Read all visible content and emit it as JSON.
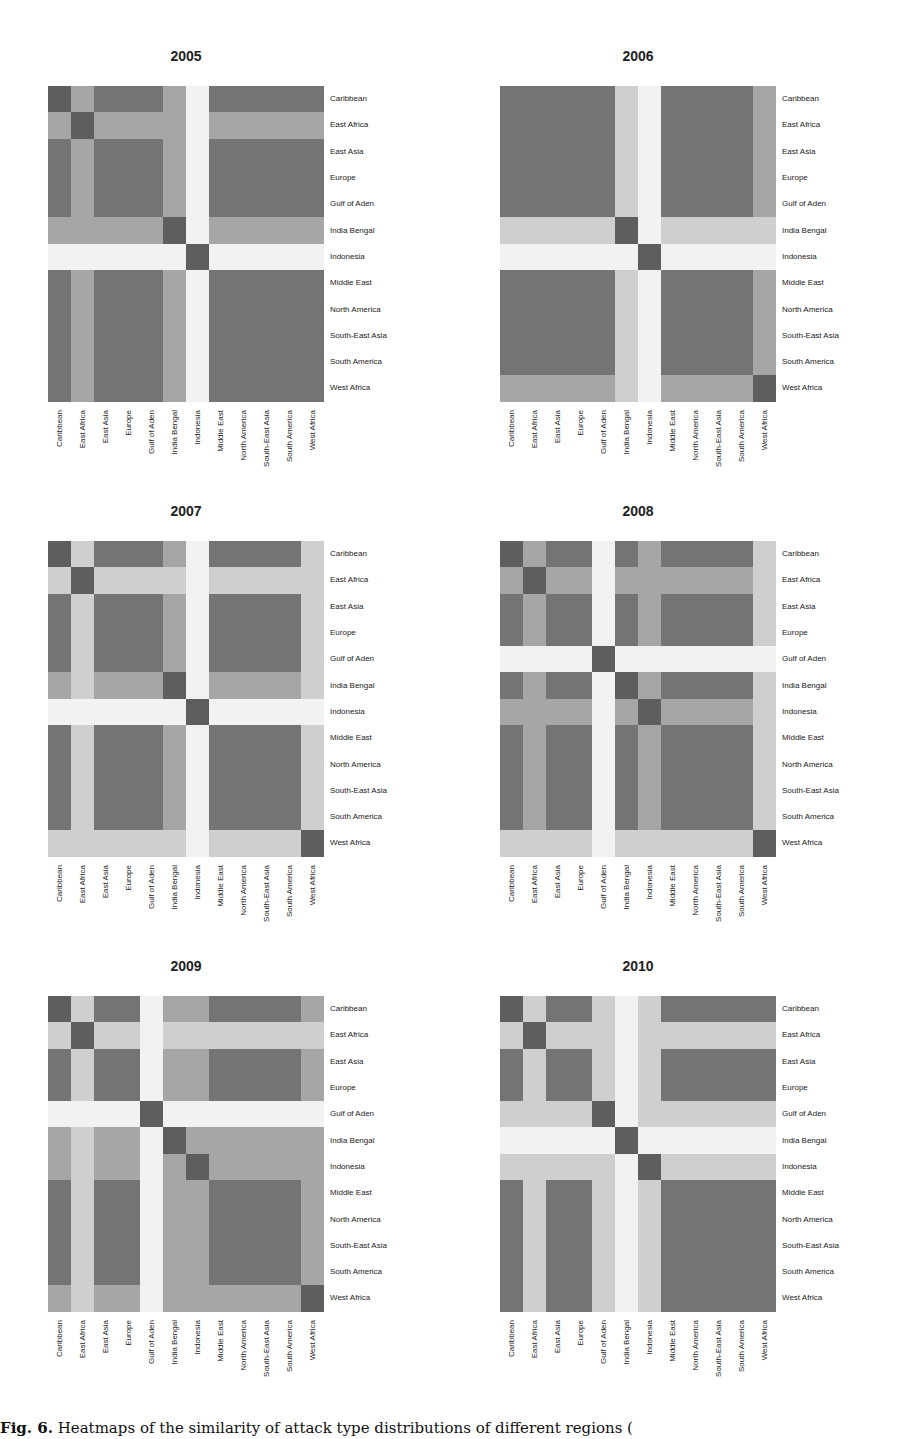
{
  "caption": {
    "label": "Fig. 6.",
    "text": " Heatmaps of the similarity of attack type distributions of different regions ("
  },
  "level_colors": {
    "0": "#f2f2f2",
    "1": "#cfcfcf",
    "2": "#a6a6a6",
    "3": "#747474",
    "4": "#5e5e5e"
  },
  "chart_data": [
    {
      "type": "heatmap",
      "title": "2005",
      "labels": [
        "Caribbean",
        "East Africa",
        "East Asia",
        "Europe",
        "Gulf of Aden",
        "India Bengal",
        "Indonesia",
        "Middle East",
        "North America",
        "South-East Asia",
        "South America",
        "West Africa"
      ],
      "value_scale": "0 = dissimilar (white) ... 4 = identical (darkest)",
      "matrix": [
        [
          4,
          2,
          3,
          3,
          3,
          2,
          0,
          3,
          3,
          3,
          3,
          3
        ],
        [
          2,
          4,
          2,
          2,
          2,
          2,
          0,
          2,
          2,
          2,
          2,
          2
        ],
        [
          3,
          2,
          3,
          3,
          3,
          2,
          0,
          3,
          3,
          3,
          3,
          3
        ],
        [
          3,
          2,
          3,
          3,
          3,
          2,
          0,
          3,
          3,
          3,
          3,
          3
        ],
        [
          3,
          2,
          3,
          3,
          3,
          2,
          0,
          3,
          3,
          3,
          3,
          3
        ],
        [
          2,
          2,
          2,
          2,
          2,
          4,
          0,
          2,
          2,
          2,
          2,
          2
        ],
        [
          0,
          0,
          0,
          0,
          0,
          0,
          4,
          0,
          0,
          0,
          0,
          0
        ],
        [
          3,
          2,
          3,
          3,
          3,
          2,
          0,
          3,
          3,
          3,
          3,
          3
        ],
        [
          3,
          2,
          3,
          3,
          3,
          2,
          0,
          3,
          3,
          3,
          3,
          3
        ],
        [
          3,
          2,
          3,
          3,
          3,
          2,
          0,
          3,
          3,
          3,
          3,
          3
        ],
        [
          3,
          2,
          3,
          3,
          3,
          2,
          0,
          3,
          3,
          3,
          3,
          3
        ],
        [
          3,
          2,
          3,
          3,
          3,
          2,
          0,
          3,
          3,
          3,
          3,
          3
        ]
      ]
    },
    {
      "type": "heatmap",
      "title": "2006",
      "labels": [
        "Caribbean",
        "East Africa",
        "East Asia",
        "Europe",
        "Gulf of Aden",
        "India Bengal",
        "Indonesia",
        "Middle East",
        "North America",
        "South-East Asia",
        "South America",
        "West Africa"
      ],
      "value_scale": "0 = dissimilar (white) ... 4 = identical (darkest)",
      "matrix": [
        [
          3,
          3,
          3,
          3,
          3,
          1,
          0,
          3,
          3,
          3,
          3,
          2
        ],
        [
          3,
          3,
          3,
          3,
          3,
          1,
          0,
          3,
          3,
          3,
          3,
          2
        ],
        [
          3,
          3,
          3,
          3,
          3,
          1,
          0,
          3,
          3,
          3,
          3,
          2
        ],
        [
          3,
          3,
          3,
          3,
          3,
          1,
          0,
          3,
          3,
          3,
          3,
          2
        ],
        [
          3,
          3,
          3,
          3,
          3,
          1,
          0,
          3,
          3,
          3,
          3,
          2
        ],
        [
          1,
          1,
          1,
          1,
          1,
          4,
          0,
          1,
          1,
          1,
          1,
          1
        ],
        [
          0,
          0,
          0,
          0,
          0,
          0,
          4,
          0,
          0,
          0,
          0,
          0
        ],
        [
          3,
          3,
          3,
          3,
          3,
          1,
          0,
          3,
          3,
          3,
          3,
          2
        ],
        [
          3,
          3,
          3,
          3,
          3,
          1,
          0,
          3,
          3,
          3,
          3,
          2
        ],
        [
          3,
          3,
          3,
          3,
          3,
          1,
          0,
          3,
          3,
          3,
          3,
          2
        ],
        [
          3,
          3,
          3,
          3,
          3,
          1,
          0,
          3,
          3,
          3,
          3,
          2
        ],
        [
          2,
          2,
          2,
          2,
          2,
          1,
          0,
          2,
          2,
          2,
          2,
          4
        ]
      ]
    },
    {
      "type": "heatmap",
      "title": "2007",
      "labels": [
        "Caribbean",
        "East Africa",
        "East Asia",
        "Europe",
        "Gulf of Aden",
        "India Bengal",
        "Indonesia",
        "Middle East",
        "North America",
        "South-East Asia",
        "South America",
        "West Africa"
      ],
      "value_scale": "0 = dissimilar (white) ... 4 = identical (darkest)",
      "matrix": [
        [
          4,
          1,
          3,
          3,
          3,
          2,
          0,
          3,
          3,
          3,
          3,
          1
        ],
        [
          1,
          4,
          1,
          1,
          1,
          1,
          0,
          1,
          1,
          1,
          1,
          1
        ],
        [
          3,
          1,
          3,
          3,
          3,
          2,
          0,
          3,
          3,
          3,
          3,
          1
        ],
        [
          3,
          1,
          3,
          3,
          3,
          2,
          0,
          3,
          3,
          3,
          3,
          1
        ],
        [
          3,
          1,
          3,
          3,
          3,
          2,
          0,
          3,
          3,
          3,
          3,
          1
        ],
        [
          2,
          1,
          2,
          2,
          2,
          4,
          0,
          2,
          2,
          2,
          2,
          1
        ],
        [
          0,
          0,
          0,
          0,
          0,
          0,
          4,
          0,
          0,
          0,
          0,
          0
        ],
        [
          3,
          1,
          3,
          3,
          3,
          2,
          0,
          3,
          3,
          3,
          3,
          1
        ],
        [
          3,
          1,
          3,
          3,
          3,
          2,
          0,
          3,
          3,
          3,
          3,
          1
        ],
        [
          3,
          1,
          3,
          3,
          3,
          2,
          0,
          3,
          3,
          3,
          3,
          1
        ],
        [
          3,
          1,
          3,
          3,
          3,
          2,
          0,
          3,
          3,
          3,
          3,
          1
        ],
        [
          1,
          1,
          1,
          1,
          1,
          1,
          0,
          1,
          1,
          1,
          1,
          4
        ]
      ]
    },
    {
      "type": "heatmap",
      "title": "2008",
      "labels": [
        "Caribbean",
        "East Africa",
        "East Asia",
        "Europe",
        "Gulf of Aden",
        "India Bengal",
        "Indonesia",
        "Middle East",
        "North America",
        "South-East Asia",
        "South America",
        "West Africa"
      ],
      "value_scale": "0 = dissimilar (white) ... 4 = identical (darkest)",
      "matrix": [
        [
          4,
          2,
          3,
          3,
          0,
          3,
          2,
          3,
          3,
          3,
          3,
          1
        ],
        [
          2,
          4,
          2,
          2,
          0,
          2,
          2,
          2,
          2,
          2,
          2,
          1
        ],
        [
          3,
          2,
          3,
          3,
          0,
          3,
          2,
          3,
          3,
          3,
          3,
          1
        ],
        [
          3,
          2,
          3,
          3,
          0,
          3,
          2,
          3,
          3,
          3,
          3,
          1
        ],
        [
          0,
          0,
          0,
          0,
          4,
          0,
          0,
          0,
          0,
          0,
          0,
          0
        ],
        [
          3,
          2,
          3,
          3,
          0,
          4,
          2,
          3,
          3,
          3,
          3,
          1
        ],
        [
          2,
          2,
          2,
          2,
          0,
          2,
          4,
          2,
          2,
          2,
          2,
          1
        ],
        [
          3,
          2,
          3,
          3,
          0,
          3,
          2,
          3,
          3,
          3,
          3,
          1
        ],
        [
          3,
          2,
          3,
          3,
          0,
          3,
          2,
          3,
          3,
          3,
          3,
          1
        ],
        [
          3,
          2,
          3,
          3,
          0,
          3,
          2,
          3,
          3,
          3,
          3,
          1
        ],
        [
          3,
          2,
          3,
          3,
          0,
          3,
          2,
          3,
          3,
          3,
          3,
          1
        ],
        [
          1,
          1,
          1,
          1,
          0,
          1,
          1,
          1,
          1,
          1,
          1,
          4
        ]
      ]
    },
    {
      "type": "heatmap",
      "title": "2009",
      "labels": [
        "Caribbean",
        "East Africa",
        "East Asia",
        "Europe",
        "Gulf of Aden",
        "India Bengal",
        "Indonesia",
        "Middle East",
        "North America",
        "South-East Asia",
        "South America",
        "West Africa"
      ],
      "value_scale": "0 = dissimilar (white) ... 4 = identical (darkest)",
      "matrix": [
        [
          4,
          1,
          3,
          3,
          0,
          2,
          2,
          3,
          3,
          3,
          3,
          2
        ],
        [
          1,
          4,
          1,
          1,
          0,
          1,
          1,
          1,
          1,
          1,
          1,
          1
        ],
        [
          3,
          1,
          3,
          3,
          0,
          2,
          2,
          3,
          3,
          3,
          3,
          2
        ],
        [
          3,
          1,
          3,
          3,
          0,
          2,
          2,
          3,
          3,
          3,
          3,
          2
        ],
        [
          0,
          0,
          0,
          0,
          4,
          0,
          0,
          0,
          0,
          0,
          0,
          0
        ],
        [
          2,
          1,
          2,
          2,
          0,
          4,
          2,
          2,
          2,
          2,
          2,
          2
        ],
        [
          2,
          1,
          2,
          2,
          0,
          2,
          4,
          2,
          2,
          2,
          2,
          2
        ],
        [
          3,
          1,
          3,
          3,
          0,
          2,
          2,
          3,
          3,
          3,
          3,
          2
        ],
        [
          3,
          1,
          3,
          3,
          0,
          2,
          2,
          3,
          3,
          3,
          3,
          2
        ],
        [
          3,
          1,
          3,
          3,
          0,
          2,
          2,
          3,
          3,
          3,
          3,
          2
        ],
        [
          3,
          1,
          3,
          3,
          0,
          2,
          2,
          3,
          3,
          3,
          3,
          2
        ],
        [
          2,
          1,
          2,
          2,
          0,
          2,
          2,
          2,
          2,
          2,
          2,
          4
        ]
      ]
    },
    {
      "type": "heatmap",
      "title": "2010",
      "labels": [
        "Caribbean",
        "East Africa",
        "East Asia",
        "Europe",
        "Gulf of Aden",
        "India Bengal",
        "Indonesia",
        "Middle East",
        "North America",
        "South-East Asia",
        "South America",
        "West Africa"
      ],
      "value_scale": "0 = dissimilar (white) ... 4 = identical (darkest)",
      "matrix": [
        [
          4,
          1,
          3,
          3,
          1,
          0,
          1,
          3,
          3,
          3,
          3,
          3
        ],
        [
          1,
          4,
          1,
          1,
          1,
          0,
          1,
          1,
          1,
          1,
          1,
          1
        ],
        [
          3,
          1,
          3,
          3,
          1,
          0,
          1,
          3,
          3,
          3,
          3,
          3
        ],
        [
          3,
          1,
          3,
          3,
          1,
          0,
          1,
          3,
          3,
          3,
          3,
          3
        ],
        [
          1,
          1,
          1,
          1,
          4,
          0,
          1,
          1,
          1,
          1,
          1,
          1
        ],
        [
          0,
          0,
          0,
          0,
          0,
          4,
          0,
          0,
          0,
          0,
          0,
          0
        ],
        [
          1,
          1,
          1,
          1,
          1,
          0,
          4,
          1,
          1,
          1,
          1,
          1
        ],
        [
          3,
          1,
          3,
          3,
          1,
          0,
          1,
          3,
          3,
          3,
          3,
          3
        ],
        [
          3,
          1,
          3,
          3,
          1,
          0,
          1,
          3,
          3,
          3,
          3,
          3
        ],
        [
          3,
          1,
          3,
          3,
          1,
          0,
          1,
          3,
          3,
          3,
          3,
          3
        ],
        [
          3,
          1,
          3,
          3,
          1,
          0,
          1,
          3,
          3,
          3,
          3,
          3
        ],
        [
          3,
          1,
          3,
          3,
          1,
          0,
          1,
          3,
          3,
          3,
          3,
          3
        ]
      ]
    }
  ]
}
